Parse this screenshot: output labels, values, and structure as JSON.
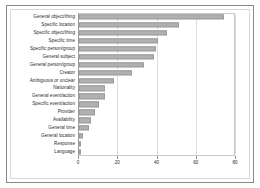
{
  "chart_data": {
    "type": "bar",
    "orientation": "horizontal",
    "title": "",
    "xlabel": "",
    "ylabel": "",
    "xlim": [
      0,
      80
    ],
    "xticks": [
      "0",
      "20",
      "40",
      "60",
      "80"
    ],
    "xtick_values": [
      0,
      20,
      40,
      60,
      80
    ],
    "grid": true,
    "grid_axis": "x",
    "legend": false,
    "bar_color": "#b0b0b0",
    "bar_edge_color": "#9d9d9d",
    "axis_color": "#8a8a86",
    "gridline_color": "#dedede",
    "categories": [
      "General object/thing",
      "Specific location",
      "Specific object/thing",
      "Specific time",
      "Specific person/group",
      "General subject",
      "General person/group",
      "Creator",
      "Ambiguous or unclear",
      "Nationality",
      "General event/action",
      "Specific event/action",
      "Provider",
      "Availability",
      "General time",
      "General location",
      "Response",
      "Language"
    ],
    "values": [
      74,
      51,
      45,
      40,
      39,
      38,
      33,
      27,
      18,
      13,
      13,
      10,
      8,
      6,
      5,
      2,
      1,
      1
    ]
  }
}
